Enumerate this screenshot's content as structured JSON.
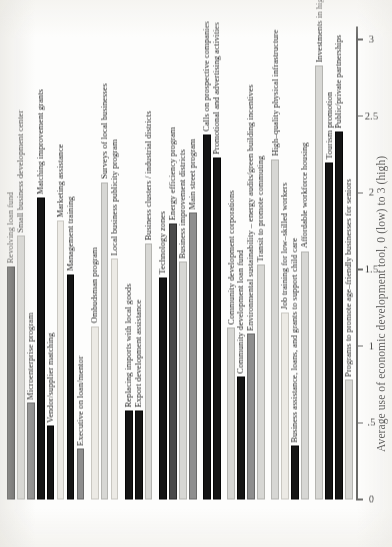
{
  "chart_data": {
    "type": "bar",
    "orientation": "vertical-rotated",
    "title": "",
    "xlabel": "",
    "ylabel": "Average use of economic development tool, 0 (low) to 3 (high)",
    "ylim": [
      0,
      3
    ],
    "yticks": [
      0,
      0.5,
      1,
      1.5,
      2,
      2.5,
      3
    ],
    "ytick_labels": [
      "0",
      ".5",
      "1",
      "1.5",
      "2",
      "2.5",
      "3"
    ],
    "grid": false,
    "legend": "none",
    "categories": [
      "Revolving loan fund",
      "Small business development center",
      "Microenterprise program",
      "Matching improvement grants",
      "Vendor/supplier matching",
      "Marketing assistance",
      "Management training",
      "Executive on loan/mentor",
      "Ombudsman program",
      "Surveys of local businesses",
      "Local business publicity program",
      "Replacing imports with local goods",
      "Export development assistance",
      "Business clusters / industrial districts",
      "Technology zones",
      "Energy efficiency program",
      "Business improvement districts",
      "Main street program",
      "Calls on prospective companies",
      "Promotional and advertising activities",
      "Community development corporations",
      "Community development loan fund",
      "Environmental sustainability – energy audits/green building incentives",
      "Transit to promote commuting",
      "High–quality physical infrastructure",
      "Job training for low–skilled workers",
      "Business assistance, loans, and grants to support child care",
      "Affordable workforce housing",
      "Investments in high quality of life",
      "Tourism promotion",
      "Public/private partnerships",
      "Programs to promote age–friendly businesses for seniors"
    ],
    "values": [
      1.52,
      1.72,
      0.63,
      1.97,
      0.48,
      1.82,
      1.47,
      0.33,
      1.13,
      2.07,
      1.57,
      0.58,
      0.58,
      1.67,
      1.45,
      1.8,
      1.55,
      1.87,
      2.38,
      2.23,
      1.12,
      0.8,
      1.08,
      1.53,
      2.22,
      1.22,
      0.35,
      1.62,
      2.83,
      2.2,
      2.4,
      0.78
    ],
    "shades": [
      "dark",
      "light",
      "mid",
      "black",
      "black",
      "pale",
      "black",
      "mid",
      "pale",
      "light",
      "pale",
      "black",
      "black",
      "light",
      "black",
      "dark",
      "light",
      "mid",
      "black",
      "black",
      "light",
      "black",
      "mid",
      "light",
      "light",
      "pale",
      "black",
      "light",
      "light",
      "black",
      "black",
      "light"
    ],
    "groups": [
      {
        "name": "Business finance & assistance",
        "start": 0,
        "count": 8
      },
      {
        "name": "Outreach & publicity",
        "start": 8,
        "count": 3
      },
      {
        "name": "Trade & clusters",
        "start": 11,
        "count": 3
      },
      {
        "name": "Districts & zones",
        "start": 14,
        "count": 4
      },
      {
        "name": "Marketing & recruitment",
        "start": 18,
        "count": 2
      },
      {
        "name": "Community development",
        "start": 20,
        "count": 4
      },
      {
        "name": "Workforce & infrastructure",
        "start": 24,
        "count": 4
      },
      {
        "name": "Quality of life & partnership",
        "start": 28,
        "count": 4
      }
    ],
    "colors": {
      "black": "#141414",
      "dark": "#4a4a4a",
      "mid": "#8e8e8e",
      "light": "#d7d7d4",
      "pale": "#eceae5",
      "axis": "#6a6a68",
      "text": "#1f1f1f",
      "background": "#fdfdfc"
    }
  }
}
